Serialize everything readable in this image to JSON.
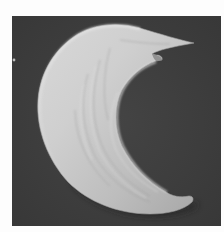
{
  "image": {
    "subject": "crescent-shaped cell micrograph",
    "style": "grayscale scanning electron micrograph",
    "colors": {
      "page_background": "#fdfdfd",
      "frame_background": "#3e3e3e",
      "cell_highlight": "#d6d6d6",
      "cell_midtone": "#b4b4b4",
      "cell_shadow": "#8a8a8a",
      "drop_shadow": "#262626"
    }
  }
}
